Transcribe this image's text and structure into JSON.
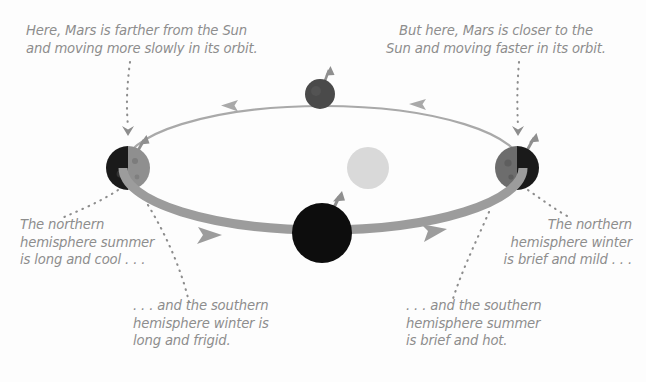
{
  "figure": {
    "background_color": "#fdfdfd",
    "text_color": "#8d8d8d"
  },
  "annotations": {
    "top_left": "Here, Mars is farther from the Sun\nand moving more slowly in its orbit.",
    "top_right": "But here, Mars is closer to the\nSun and moving faster in its orbit.",
    "bottom_left": "The northern\nhemisphere summer\nis long and cool . . .",
    "bottom_right": "The northern\nhemisphere winter\nis brief and mild . . .",
    "bottom_center_left": ". . . and the southern\nhemisphere winter is\nlong and frigid.",
    "bottom_center_right": ". . . and the southern\nhemisphere summer\nis brief and hot."
  },
  "diagram": {
    "type": "orbit-perspective",
    "sun": {
      "label": "Sun",
      "cx": 368,
      "cy": 168,
      "r": 21,
      "color": "#d9d9d9"
    },
    "orbit": {
      "cx": 323,
      "cy": 168,
      "rx": 200,
      "ry": 62,
      "back_color": "#a9a9a9",
      "front_color": "#9c9c9c",
      "back_width": 2.2,
      "front_width": 9
    },
    "direction_arrows": [
      {
        "name": "back-left-arrow",
        "x": 226,
        "y": 104,
        "rotation": 186,
        "color": "#a9a9a9"
      },
      {
        "name": "back-right-arrow",
        "x": 414,
        "y": 104,
        "rotation": 174,
        "color": "#a9a9a9"
      },
      {
        "name": "front-left-arrow",
        "x": 212,
        "y": 235,
        "rotation": 8,
        "color": "#9c9c9c"
      },
      {
        "name": "front-right-arrow",
        "x": 437,
        "y": 232,
        "rotation": -12,
        "color": "#9c9c9c"
      }
    ],
    "planets": [
      {
        "name": "mars-aphelion",
        "position": "left",
        "cx": 128,
        "cy": 168,
        "r": 22,
        "dark_color": "#1a1a1a",
        "light_color": "#8f8f8f",
        "lit_side": "right",
        "axis": {
          "dx": 16,
          "dy": -28,
          "color": "#8f8f8f"
        }
      },
      {
        "name": "mars-back",
        "position": "top",
        "cx": 320,
        "cy": 94,
        "r": 15,
        "dark_color": "#4a4a4a",
        "light_color": "#4a4a4a",
        "lit_side": "none",
        "axis": {
          "dx": 9,
          "dy": -24,
          "color": "#8f8f8f"
        }
      },
      {
        "name": "mars-perihelion",
        "position": "right",
        "cx": 517,
        "cy": 168,
        "r": 22,
        "dark_color": "#1a1a1a",
        "light_color": "#6d6d6d",
        "lit_side": "left",
        "axis": {
          "dx": 17,
          "dy": -30,
          "color": "#8f8f8f"
        }
      },
      {
        "name": "mars-front",
        "position": "bottom",
        "cx": 322,
        "cy": 233,
        "r": 30,
        "dark_color": "#0d0d0d",
        "light_color": "#0d0d0d",
        "lit_side": "none",
        "axis": {
          "dx": 17,
          "dy": -36,
          "color": "#8f8f8f"
        }
      }
    ],
    "leaders": [
      {
        "name": "leader-top-left",
        "kind": "dotted-arrow",
        "path": "M 130 62 C 127 85, 126 105, 128 126",
        "arrow_at": [
          128,
          133
        ],
        "arrow_rot": 92
      },
      {
        "name": "leader-top-right",
        "kind": "dotted-arrow",
        "path": "M 519 62 C 517 85, 517 106, 518 126",
        "arrow_at": [
          518,
          133
        ],
        "arrow_rot": 90
      },
      {
        "name": "leader-bottom-left",
        "kind": "dotted",
        "path": "M 118 190 C 100 202, 80 210, 62 218"
      },
      {
        "name": "leader-bottom-center-left",
        "kind": "dotted",
        "path": "M 148 205 C 166 236, 180 270, 188 302"
      },
      {
        "name": "leader-bottom-right",
        "kind": "dotted",
        "path": "M 528 190 C 541 200, 552 208, 566 216"
      },
      {
        "name": "leader-bottom-center-right",
        "kind": "dotted",
        "path": "M 489 212 C 476 242, 462 272, 452 302"
      }
    ]
  }
}
